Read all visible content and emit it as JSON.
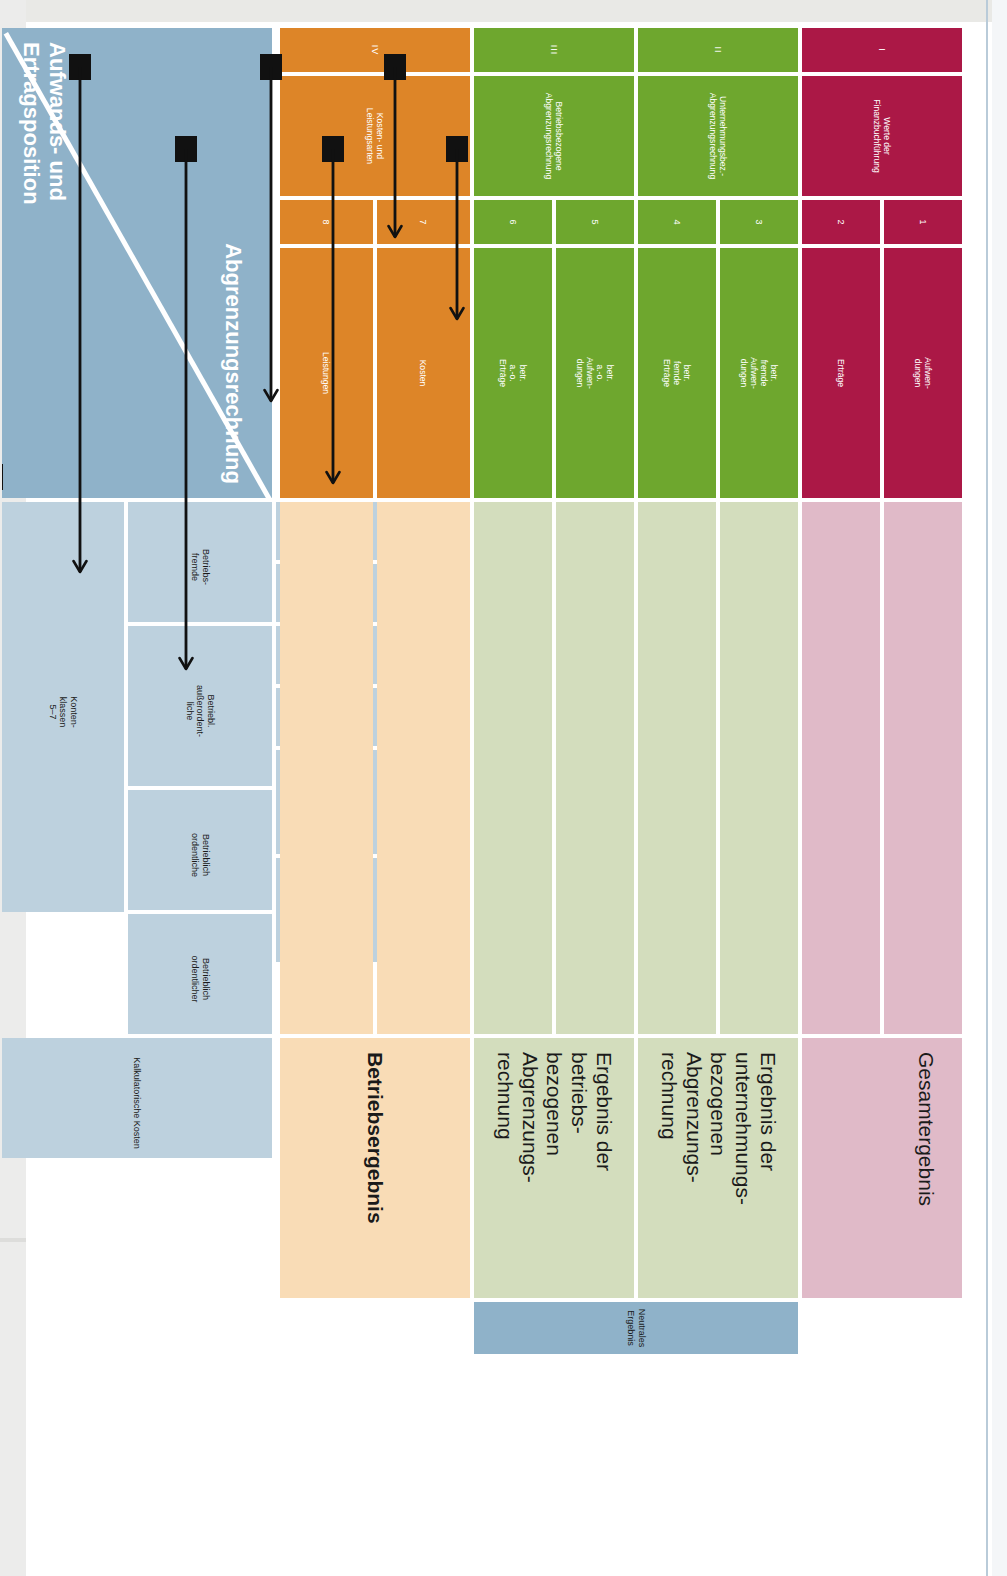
{
  "figure": {
    "title": "Abgrenzungsrechnung",
    "corner": {
      "top_label": "Abgrenzungsrechnung",
      "bottom_label": "Aufwands- und\nErtragsposition"
    },
    "neutral_band_label": "Neutrales Ergebnis",
    "column_groups": [
      {
        "roman": "I",
        "name": "Werte der\nFinanzbuchführung",
        "color": "#ab1846",
        "body_color": "#e0bac8",
        "result_label": "Gesamtergebnis",
        "columns": [
          {
            "num": "1",
            "label": "Aufwen-\ndungen"
          },
          {
            "num": "2",
            "label": "Erträge"
          }
        ]
      },
      {
        "roman": "II",
        "name": "Unternehmungsbez.-\nAbgrenzungsrechnung",
        "color": "#6ea72e",
        "body_color": "#d3ddbd",
        "result_label": "Ergebnis der\nunternehmungs-\nbezogenen\nAbgrenzungs-\nrechnung",
        "columns": [
          {
            "num": "3",
            "label": "betr.\nfremde\nAufwen-\ndungen"
          },
          {
            "num": "4",
            "label": "betr.\nfemde\nErträge"
          }
        ]
      },
      {
        "roman": "III",
        "name": "Betriebsbezogene\nAbgrenzungsrechnung",
        "color": "#6ea72e",
        "body_color": "#d3ddbd",
        "result_label": "Ergebnis der\nbetriebs-\nbezogenen\nAbgrenzungs-\nrechnung",
        "columns": [
          {
            "num": "5",
            "label": "betr.\na.-o.\nAufwen-\ndungen"
          },
          {
            "num": "6",
            "label": "betr.\na.-o.\nErträge"
          }
        ]
      },
      {
        "roman": "IV",
        "name": "Kosten- und\nLeistungsarten",
        "color": "#dd8528",
        "body_color": "#f9dcb6",
        "result_label": "Betriebsergebnis",
        "columns": [
          {
            "num": "7",
            "label": "Kosten"
          },
          {
            "num": "8",
            "label": "Leistungen"
          }
        ]
      }
    ],
    "rows": [
      {
        "group": "Konten-\nklassen\n5–7",
        "category": "Betriebs-\nfremde",
        "position": "Erträge"
      },
      {
        "group": "Konten-\nklassen\n5–7",
        "category": "Betriebs-\nfremde",
        "position": "Aufwendungen"
      },
      {
        "group": "Konten-\nklassen\n5–7",
        "category": "Betriebl.\naußerordent-\nliche",
        "position": "Erträge"
      },
      {
        "group": "Konten-\nklassen\n5–7",
        "category": "Betriebl.\naußerordent-\nliche",
        "position": "Aufwendungen"
      },
      {
        "group": "Konten-\nklassen\n5–7",
        "category": "Betrieblich\nordentliche",
        "position": "Erträge\nLeistungen"
      },
      {
        "group": "Konten-\nklassen\n5–7",
        "category": "Betrieblich\nordentlicher",
        "position": "Zweckaufwand\n(Grundkosten)"
      },
      {
        "group": "",
        "category": "Kalkulatorische Kosten",
        "position": ""
      }
    ],
    "row_group_labels": [
      {
        "label": "Konten-\nklassen\n5–7",
        "rows": 6
      },
      {
        "label": "Kalkulatorische Kosten",
        "rows": 1
      }
    ],
    "row_categories": [
      {
        "label": "Betriebs-\nfremde",
        "rows": 2
      },
      {
        "label": "Betriebl.\naußerordent-\nliche",
        "rows": 2
      },
      {
        "label": "Betrieblich\nordentliche",
        "rows": 1
      },
      {
        "label": "Betrieblich\nordentlicher",
        "rows": 1
      },
      {
        "label": "Kalkulatorische Kosten",
        "rows": 1
      }
    ],
    "row_positions": [
      "Erträge",
      "Aufwendungen",
      "Erträge",
      "Aufwendungen",
      "Erträge\nLeistungen",
      "Zweckaufwand\n(Grundkosten)",
      ""
    ],
    "flows": [
      {
        "row": 0,
        "from_column": "2",
        "to_column": "4",
        "label": "betriebsfremde Erträge → betr. fremde Erträge"
      },
      {
        "row": 1,
        "from_column": "1",
        "to_column": "3",
        "label": "betriebsfremde Aufwendungen → betr. fremde Aufwendungen"
      },
      {
        "row": 2,
        "from_column": "2",
        "to_column": "6",
        "label": "betriebl. a.o. Erträge → betr. a.-o. Erträge"
      },
      {
        "row": 3,
        "from_column": "1",
        "to_column": "5",
        "label": "betriebl. a.o. Aufwendungen → betr. a.-o. Aufwendungen"
      },
      {
        "row": 4,
        "from_column": "2",
        "to_column": "8",
        "label": "Erträge/Leistungen → Leistungen"
      },
      {
        "row": 5,
        "from_column": "1",
        "to_column": "7",
        "label": "Zweckaufwand (Grundkosten) → Kosten"
      },
      {
        "row": 6,
        "from_column": "6",
        "to_column": "7",
        "label": "Kalkulatorische Kosten → Kosten"
      }
    ]
  }
}
